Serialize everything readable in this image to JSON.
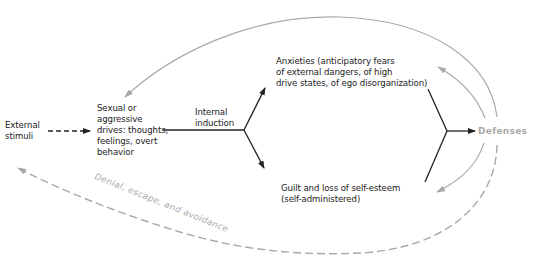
{
  "colors": {
    "ink": "#222222",
    "grey": "#a9a9a9",
    "background": "#ffffff"
  },
  "nodes": {
    "external_stimuli": "External\nstimuli",
    "drives": "Sexual or\naggressive\ndrives: thoughts,\nfeelings, overt\nbehavior",
    "internal_induction": "Internal\ninduction",
    "anxieties": "Anxieties (anticipatory fears\nof external dangers, of high\ndrive states, of ego disorganization)",
    "guilt": "Guilt and loss of self-esteem\n(self-administered)",
    "defenses": "Defenses"
  },
  "edge_labels": {
    "denial": "Denial, escape, and avoidance"
  }
}
